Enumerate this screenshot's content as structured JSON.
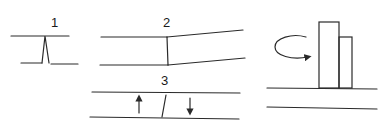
{
  "diagram": {
    "panels": [
      {
        "id": "panel-1",
        "label": "1",
        "description": "Narrow pointed wedge between two horizontal lines"
      },
      {
        "id": "panel-2",
        "label": "2",
        "description": "Vertical junction between parallel lines, right side diverging upward"
      },
      {
        "id": "panel-3",
        "label": "3",
        "description": "Slanted divider between parallel lines with opposing up and down arrows"
      },
      {
        "id": "panel-4",
        "label": "",
        "description": "Two adjacent vertical blocks on a base line with curved rotation arrow"
      }
    ],
    "arrows": {
      "panel_3_left": "up-arrow",
      "panel_3_right": "down-arrow",
      "panel_4": "rotation-arrow"
    },
    "colors": {
      "stroke": "#2a2a2a",
      "background": "#ffffff"
    }
  }
}
